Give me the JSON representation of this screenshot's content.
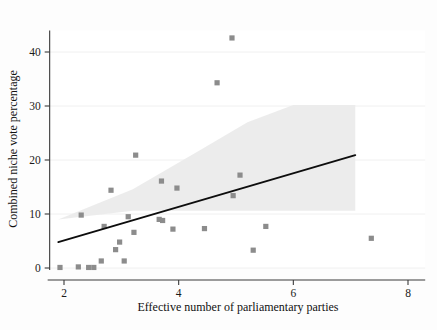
{
  "figure": {
    "background_color": "#fdfdfd",
    "plot_background_color": "#ffffff",
    "marker_color": "#8c8c8c",
    "fitline_color": "#0d0d0d",
    "ci_band_color": "#ebebeb",
    "axis_color": "#3a3a3a"
  },
  "chart_data": {
    "type": "scatter",
    "title": "",
    "subtitle": "",
    "xlabel": "Effective number of parliamentary parties",
    "ylabel": "Combined niche vote percentage",
    "xlim": [
      1.75,
      8.3
    ],
    "ylim": [
      -1.5,
      44
    ],
    "xticks": [
      2,
      4,
      6,
      8
    ],
    "xtick_labels": [
      "2",
      "4",
      "6",
      "8"
    ],
    "yticks": [
      0,
      10,
      20,
      30,
      40
    ],
    "ytick_labels": [
      "0",
      "10",
      "20",
      "30",
      "40"
    ],
    "grid": "horizontal-light",
    "legend": "none",
    "legend_position": "none",
    "points": [
      {
        "x": 1.93,
        "y": 0.1
      },
      {
        "x": 2.25,
        "y": 0.2
      },
      {
        "x": 2.3,
        "y": 9.8
      },
      {
        "x": 2.43,
        "y": 0.1
      },
      {
        "x": 2.52,
        "y": 0.1
      },
      {
        "x": 2.65,
        "y": 1.3
      },
      {
        "x": 2.7,
        "y": 7.7
      },
      {
        "x": 2.82,
        "y": 14.4
      },
      {
        "x": 2.9,
        "y": 3.4
      },
      {
        "x": 2.97,
        "y": 4.8
      },
      {
        "x": 3.05,
        "y": 1.3
      },
      {
        "x": 3.12,
        "y": 9.5
      },
      {
        "x": 3.22,
        "y": 6.6
      },
      {
        "x": 3.25,
        "y": 20.9
      },
      {
        "x": 3.66,
        "y": 9.0
      },
      {
        "x": 3.72,
        "y": 8.8
      },
      {
        "x": 3.7,
        "y": 16.1
      },
      {
        "x": 3.9,
        "y": 7.2
      },
      {
        "x": 3.97,
        "y": 14.8
      },
      {
        "x": 4.45,
        "y": 7.3
      },
      {
        "x": 4.67,
        "y": 34.3
      },
      {
        "x": 4.93,
        "y": 42.6
      },
      {
        "x": 4.95,
        "y": 13.4
      },
      {
        "x": 5.07,
        "y": 17.2
      },
      {
        "x": 5.3,
        "y": 3.3
      },
      {
        "x": 5.52,
        "y": 7.7
      },
      {
        "x": 7.36,
        "y": 5.5
      }
    ],
    "fit_line": {
      "x_start": 1.9,
      "y_start": 4.8,
      "x_end": 7.08,
      "y_end": 20.9
    },
    "ci_band": {
      "description": "shaded 95% confidence region around fit line",
      "upper": [
        {
          "x": 1.9,
          "y": 9.0
        },
        {
          "x": 3.2,
          "y": 14.6
        },
        {
          "x": 4.4,
          "y": 22.0
        },
        {
          "x": 5.2,
          "y": 27.0
        },
        {
          "x": 6.0,
          "y": 30.2
        },
        {
          "x": 7.08,
          "y": 30.2
        }
      ],
      "lower": [
        {
          "x": 1.9,
          "y": 9.0
        },
        {
          "x": 3.2,
          "y": 10.6
        },
        {
          "x": 4.4,
          "y": 10.6
        },
        {
          "x": 5.2,
          "y": 10.6
        },
        {
          "x": 6.0,
          "y": 10.6
        },
        {
          "x": 7.08,
          "y": 10.6
        }
      ]
    }
  }
}
